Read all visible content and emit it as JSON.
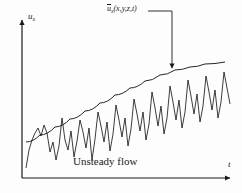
{
  "figure": {
    "caption": "Unsteady flow",
    "y_axis_label": "u",
    "y_axis_sub": "x",
    "x_axis_label": "t",
    "mean_label_bar": "u",
    "mean_label_sub": "x",
    "mean_label_args": "(x,y,z,t)",
    "stroke_color": "#1a1a1a",
    "background": "#fdfdfd"
  },
  "chart_data": {
    "type": "line",
    "title": "Unsteady flow",
    "xlabel": "t",
    "ylabel": "u_x",
    "grid": false,
    "legend": "none",
    "annotations": [
      {
        "text": "ū_x (x,y,z,t)",
        "target_x": 172,
        "target_y": 73,
        "label_x": 107,
        "label_y": 10
      }
    ],
    "axes": {
      "x_origin": 22,
      "y_origin": 178,
      "x_end": 232,
      "y_end": 18
    },
    "series": [
      {
        "name": "mean",
        "kind": "smooth-trend",
        "points": [
          [
            26,
            142
          ],
          [
            40,
            135
          ],
          [
            55,
            127
          ],
          [
            70,
            119
          ],
          [
            85,
            111
          ],
          [
            100,
            103
          ],
          [
            115,
            95
          ],
          [
            130,
            88
          ],
          [
            145,
            81
          ],
          [
            160,
            75
          ],
          [
            175,
            70
          ],
          [
            190,
            67
          ],
          [
            205,
            64
          ],
          [
            225,
            62
          ]
        ]
      },
      {
        "name": "instantaneous",
        "kind": "turbulent-fluctuation",
        "points": [
          [
            26,
            168
          ],
          [
            29,
            150
          ],
          [
            32,
            140
          ],
          [
            35,
            133
          ],
          [
            38,
            128
          ],
          [
            41,
            136
          ],
          [
            44,
            125
          ],
          [
            47,
            133
          ],
          [
            50,
            152
          ],
          [
            53,
            142
          ],
          [
            56,
            160
          ],
          [
            59,
            146
          ],
          [
            62,
            118
          ],
          [
            65,
            140
          ],
          [
            68,
            150
          ],
          [
            71,
            131
          ],
          [
            74,
            157
          ],
          [
            77,
            141
          ],
          [
            80,
            120
          ],
          [
            83,
            132
          ],
          [
            86,
            148
          ],
          [
            89,
            128
          ],
          [
            92,
            160
          ],
          [
            95,
            139
          ],
          [
            98,
            112
          ],
          [
            101,
            126
          ],
          [
            104,
            142
          ],
          [
            107,
            122
          ],
          [
            110,
            151
          ],
          [
            113,
            134
          ],
          [
            116,
            105
          ],
          [
            119,
            120
          ],
          [
            122,
            137
          ],
          [
            125,
            118
          ],
          [
            128,
            146
          ],
          [
            131,
            129
          ],
          [
            134,
            99
          ],
          [
            137,
            114
          ],
          [
            140,
            131
          ],
          [
            143,
            112
          ],
          [
            146,
            140
          ],
          [
            149,
            124
          ],
          [
            152,
            92
          ],
          [
            155,
            108
          ],
          [
            158,
            126
          ],
          [
            161,
            106
          ],
          [
            164,
            134
          ],
          [
            167,
            118
          ],
          [
            170,
            86
          ],
          [
            173,
            102
          ],
          [
            176,
            120
          ],
          [
            179,
            100
          ],
          [
            182,
            128
          ],
          [
            185,
            112
          ],
          [
            188,
            80
          ],
          [
            191,
            96
          ],
          [
            194,
            114
          ],
          [
            197,
            94
          ],
          [
            200,
            122
          ],
          [
            203,
            106
          ],
          [
            206,
            76
          ],
          [
            209,
            92
          ],
          [
            212,
            110
          ],
          [
            215,
            90
          ],
          [
            218,
            118
          ],
          [
            221,
            102
          ],
          [
            224,
            72
          ],
          [
            227,
            88
          ],
          [
            230,
            104
          ]
        ]
      }
    ]
  }
}
